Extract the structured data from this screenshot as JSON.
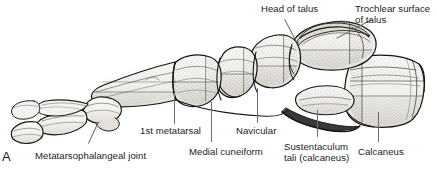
{
  "figure": {
    "panel_letter": "A",
    "background_color": "#ffffff",
    "ink_color": "#1b1b1b",
    "bone_fill_color": "#f2f1ee",
    "bone_shadow_color": "#cfcdc8",
    "leader_color": "#6d6d6d"
  },
  "labels": {
    "head_of_talus": "Head of talus",
    "trochlear_surface_of_talus": "Trochlear surface\nof talus",
    "first_metatarsal": "1st metatarsal",
    "navicular": "Navicular",
    "metatarsophalangeal_joint": "Metatarsophalangeal joint",
    "medial_cuneiform": "Medial cuneiform",
    "sustentaculum_tali": "Sustentaculum\ntali (calcaneus)",
    "calcaneus": "Calcaneus"
  }
}
